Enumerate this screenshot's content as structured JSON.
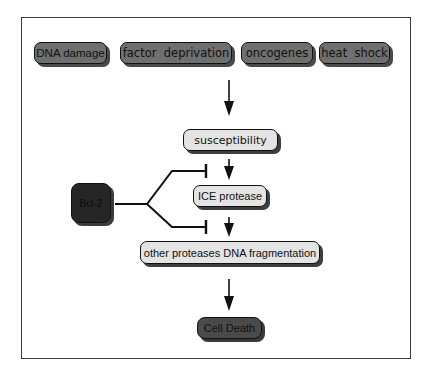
{
  "diagram": {
    "inputs": [
      {
        "id": "dna-damage",
        "label": "DNA damage"
      },
      {
        "id": "factor-deprivation",
        "label": "factor  deprivation"
      },
      {
        "id": "oncogenes",
        "label": "oncogenes"
      },
      {
        "id": "heat-shock",
        "label": "heat  shock"
      }
    ],
    "pathway": [
      {
        "id": "susceptibility",
        "label": "susceptibility"
      },
      {
        "id": "ice-protease",
        "label": "ICE protease"
      },
      {
        "id": "other-proteases",
        "label": "other proteases DNA fragmentation"
      },
      {
        "id": "cell-death",
        "label": "Cell Death"
      }
    ],
    "inhibitor": {
      "id": "bcl-2",
      "label": "Bcl-2",
      "targets": [
        "susceptibility -> ICE protease",
        "ICE protease -> other proteases DNA fragmentation"
      ]
    },
    "colors": {
      "input_fill": "#6f6f6f",
      "pathway_fill": "#e4e4e4",
      "inhibitor_fill": "#262626",
      "death_fill": "#4a4a4a",
      "line": "#111111"
    }
  }
}
